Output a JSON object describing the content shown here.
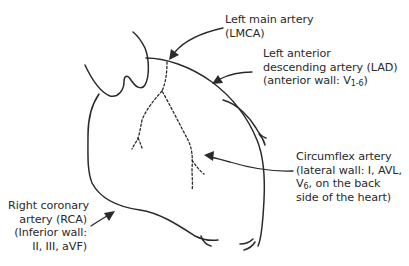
{
  "diagram": {
    "colors": {
      "background": "#ffffff",
      "ink": "#2a2a2a"
    },
    "labels": [
      {
        "id": "lmca",
        "lines": [
          "Left main artery",
          "(LMCA)"
        ]
      },
      {
        "id": "lad",
        "lines": [
          "Left anterior",
          "descending artery (LAD)",
          "(anterior wall: V"
        ],
        "subscript": "1-6",
        "suffix": ")"
      },
      {
        "id": "circumflex",
        "lines": [
          "Circumflex artery",
          "(lateral wall: I, AVL,",
          "V"
        ],
        "subscript": "6",
        "line3_suffix": ", on the back",
        "line4": "side of the heart)"
      },
      {
        "id": "rca",
        "lines": [
          "Right coronary",
          "artery (RCA)",
          "(Inferior wall:",
          "II, III, aVF)"
        ]
      }
    ]
  }
}
